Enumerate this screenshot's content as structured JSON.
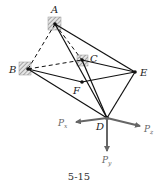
{
  "figure": {
    "caption": "5-15",
    "points": {
      "A": {
        "label": "A",
        "x": 55,
        "y": 24,
        "support": true
      },
      "B": {
        "label": "B",
        "x": 28,
        "y": 69,
        "support": true
      },
      "C": {
        "label": "C",
        "x": 82,
        "y": 60,
        "support": true
      },
      "E": {
        "label": "E",
        "x": 135,
        "y": 72,
        "support": false
      },
      "F": {
        "label": "F",
        "x": 82,
        "y": 82,
        "support": false
      },
      "D": {
        "label": "D",
        "x": 107,
        "y": 118,
        "support": false
      }
    },
    "members_solid": [
      [
        "A",
        "E"
      ],
      [
        "A",
        "D"
      ],
      [
        "C",
        "E"
      ],
      [
        "C",
        "D"
      ],
      [
        "B",
        "F"
      ],
      [
        "F",
        "E"
      ],
      [
        "B",
        "D"
      ],
      [
        "E",
        "D"
      ]
    ],
    "members_dashed": [
      [
        "A",
        "B"
      ],
      [
        "A",
        "C"
      ],
      [
        "B",
        "C"
      ]
    ],
    "forces": [
      {
        "name": "P",
        "sub": "x",
        "label": "Px",
        "tip_x": 74,
        "tip_y": 123
      },
      {
        "name": "P",
        "sub": "z",
        "label": "Pz",
        "tip_x": 142,
        "tip_y": 127
      },
      {
        "name": "P",
        "sub": "y",
        "label": "Py",
        "tip_x": 107,
        "tip_y": 153
      }
    ],
    "colors": {
      "members": "#111111",
      "forces": "#666666",
      "hatch": "#888888"
    }
  }
}
